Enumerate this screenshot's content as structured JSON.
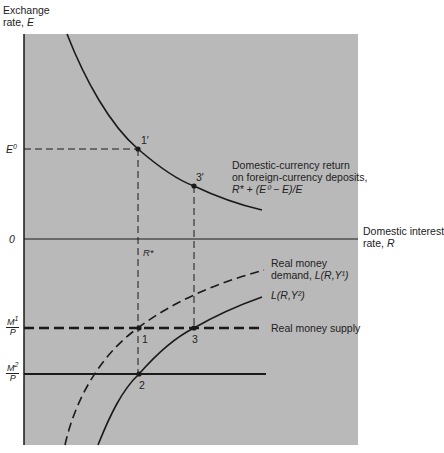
{
  "axes": {
    "y_label_line1": "Exchange",
    "y_label_line2": "rate, ",
    "y_label_var": "E",
    "x_label_line1": "Domestic interest",
    "x_label_line2": "rate, ",
    "x_label_var": "R",
    "origin": "0",
    "bottom_partial": "Interest"
  },
  "ticks": {
    "e0": "E",
    "e0_sup": "0",
    "r_star": "R*",
    "m1_num": "M",
    "m1_num_sup": "1",
    "m_den": "P",
    "m2_num": "M",
    "m2_num_sup": "2"
  },
  "points": {
    "p1prime": "1′",
    "p3prime": "3′",
    "p1": "1",
    "p2": "2",
    "p3": "3"
  },
  "curves": {
    "return_line1": "Domestic-currency return",
    "return_line2": "on foreign-currency deposits,",
    "return_formula": "R* + (E⁰ − E)/E",
    "demand1_line1": "Real money",
    "demand1_line2": "demand, ",
    "demand1_formula": "L(R,Y¹)",
    "demand2_formula": "L(R,Y²)",
    "supply": "Real money supply"
  },
  "colors": {
    "panel": "#b9b9b9",
    "line": "#1a1a1a"
  }
}
